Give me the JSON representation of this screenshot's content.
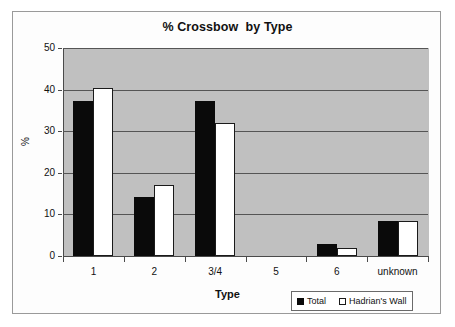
{
  "chart_data": {
    "type": "bar",
    "title": "% Crossbow  by Type",
    "xlabel": "Type",
    "ylabel": "%",
    "categories": [
      "1",
      "2",
      "3/4",
      "5",
      "6",
      "unknown"
    ],
    "series": [
      {
        "name": "Total",
        "color": "#000000",
        "values": [
          37.2,
          14.3,
          37.2,
          0,
          2.8,
          8.5
        ]
      },
      {
        "name": "Hadrian's Wall",
        "color": "#ffffff",
        "values": [
          40.4,
          17.0,
          31.9,
          0,
          2.0,
          8.5
        ]
      }
    ],
    "ylim": [
      0,
      50
    ],
    "yticks": [
      0,
      10,
      20,
      30,
      40,
      50
    ],
    "grid": true,
    "legend_position": "bottom-right",
    "plot_background": "#c0c0c0"
  },
  "legend": {
    "entries": [
      {
        "label": "Total"
      },
      {
        "label": "Hadrian's Wall"
      }
    ]
  }
}
